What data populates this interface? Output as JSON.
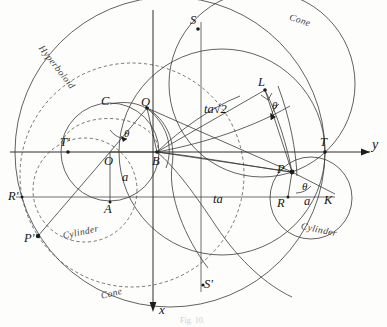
{
  "figure": {
    "caption": "Fig. 10.",
    "background_color": "#fdfdfb",
    "ink_color": "#3a3a3a"
  },
  "axes": {
    "horizontal": {
      "label": "y",
      "direction": "right",
      "arrow": true
    },
    "vertical": {
      "label": "x",
      "direction": "down",
      "arrow": true
    },
    "origin_label": "O"
  },
  "points": [
    {
      "id": "O",
      "label": "O",
      "x": 110,
      "y": 152,
      "marker": false
    },
    {
      "id": "A",
      "label": "A",
      "x": 110,
      "y": 202,
      "marker": true
    },
    {
      "id": "B",
      "label": "B",
      "x": 157,
      "y": 152,
      "marker": true
    },
    {
      "id": "C",
      "label": "C",
      "x": 110,
      "y": 104,
      "marker": false
    },
    {
      "id": "Q",
      "label": "Q",
      "x": 147,
      "y": 108,
      "marker": true
    },
    {
      "id": "S",
      "label": "S",
      "x": 198,
      "y": 29,
      "marker": true
    },
    {
      "id": "S_p",
      "label": "S'",
      "x": 203,
      "y": 285,
      "marker": true
    },
    {
      "id": "L",
      "label": "L",
      "x": 265,
      "y": 90,
      "marker": true
    },
    {
      "id": "P",
      "label": "P",
      "x": 292,
      "y": 172,
      "marker": true
    },
    {
      "id": "P_p",
      "label": "P'",
      "x": 38,
      "y": 236,
      "marker": true
    },
    {
      "id": "R",
      "label": "R",
      "x": 288,
      "y": 197,
      "marker": true
    },
    {
      "id": "R_p",
      "label": "R'",
      "x": 22,
      "y": 197,
      "marker": true
    },
    {
      "id": "T",
      "label": "T",
      "x": 325,
      "y": 152,
      "marker": true
    },
    {
      "id": "T_p",
      "label": "T'",
      "x": 68,
      "y": 152,
      "marker": true
    },
    {
      "id": "K",
      "label": "K",
      "x": 328,
      "y": 197,
      "marker": false
    }
  ],
  "segment_labels": [
    {
      "id": "ta-root2",
      "text": "ta√2",
      "x": 204,
      "y": 110
    },
    {
      "id": "ta",
      "text": "ta",
      "x": 213,
      "y": 200
    },
    {
      "id": "a-center",
      "text": "a",
      "x": 122,
      "y": 177
    },
    {
      "id": "a-right",
      "text": "a",
      "x": 308,
      "y": 201
    }
  ],
  "angle_labels": [
    {
      "id": "theta-Q",
      "text": "θ",
      "x": 128,
      "y": 133
    },
    {
      "id": "theta-L",
      "text": "θ",
      "x": 277,
      "y": 107
    },
    {
      "id": "theta-P",
      "text": "θ",
      "x": 307,
      "y": 188
    }
  ],
  "curve_labels": [
    {
      "id": "hyperboloid",
      "text": "Hyperboloid",
      "x": 44,
      "y": 44,
      "rotation": 52,
      "style": "solid"
    },
    {
      "id": "cone-top",
      "text": "Cone",
      "x": 291,
      "y": 13,
      "rotation": 18,
      "style": "solid"
    },
    {
      "id": "cone-bottom",
      "text": "Cone",
      "x": 100,
      "y": 292,
      "rotation": -14,
      "style": "dashed"
    },
    {
      "id": "cylinder-left",
      "text": "Cylinder",
      "x": 62,
      "y": 232,
      "rotation": -12,
      "style": "dashed"
    },
    {
      "id": "cylinder-right",
      "text": "Cylinder",
      "x": 302,
      "y": 222,
      "rotation": 12,
      "style": "solid"
    }
  ],
  "circles": [
    {
      "id": "hyperboloid-circle",
      "cx": 170,
      "cy": 152,
      "r": 155,
      "style": "solid",
      "note": "large outer circle labelled Hyperboloid"
    },
    {
      "id": "cone-upper-circle",
      "cx": 262,
      "cy": 84,
      "r": 93,
      "style": "solid",
      "note": "upper right circle labelled Cone"
    },
    {
      "id": "base-circle",
      "cx": 110,
      "cy": 152,
      "r": 49,
      "style": "solid",
      "note": "central circle through C, A, B"
    },
    {
      "id": "cylinder-right-circle",
      "cx": 311,
      "cy": 198,
      "r": 41,
      "style": "solid",
      "note": "right circle labelled Cylinder"
    },
    {
      "id": "cylinder-left-circle",
      "cx": 85,
      "cy": 190,
      "r": 52,
      "style": "dashed",
      "note": "left dashed circle labelled Cylinder"
    },
    {
      "id": "cone-lower-circle",
      "cx": 132,
      "cy": 175,
      "r": 112,
      "style": "dashed",
      "note": "large dashed circle labelled Cone"
    },
    {
      "id": "ellipse-main",
      "cx": 222,
      "cy": 152,
      "r": 103,
      "style": "solid",
      "note": "circle through S, T, S'"
    }
  ],
  "interaction": {
    "zoom_level": "100%",
    "selectable": false
  }
}
